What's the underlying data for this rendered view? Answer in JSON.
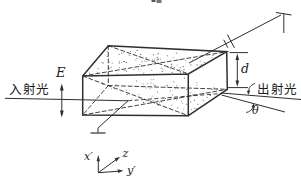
{
  "figure": {
    "kind": "electro-optic crystal modulator diagram",
    "labels": {
      "incident_light": "入射光",
      "exit_light": "出射光",
      "field": "E",
      "thickness": "d",
      "deflection_angle": "θ",
      "axis_x": "x′",
      "axis_y": "y′",
      "axis_z": "z"
    },
    "colors": {
      "line": "#2f2f2f",
      "stipple": "#4a4a4a",
      "background": "#ffffff",
      "text": "#1c1c1c"
    }
  }
}
